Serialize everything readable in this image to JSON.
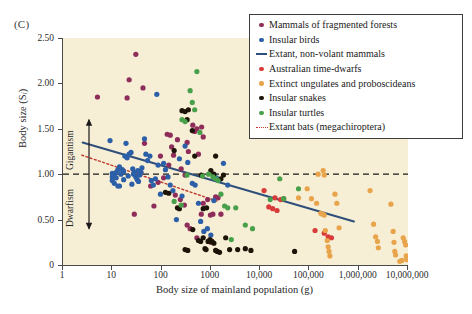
{
  "panel": {
    "label": "(C)"
  },
  "chart_data": {
    "type": "scatter",
    "title": "",
    "xlabel": "Body size of mainland population (g)",
    "ylabel": "Body size (Si)",
    "ylabel_main": "Body size (S",
    "ylabel_sub": "i",
    "ylabel_tail": ")",
    "xscale": "log",
    "xlim": [
      1,
      10000000
    ],
    "ylim": [
      0,
      2.5
    ],
    "grid": false,
    "plot_background": "#f7eed6",
    "xticks": [
      1,
      10,
      100,
      1000,
      10000,
      100000,
      1000000,
      10000000
    ],
    "xticklabels": [
      "1",
      "10",
      "100",
      "1000",
      "10,000",
      "100,000",
      "1,000,000",
      "10,000,000"
    ],
    "yticks": [
      0,
      0.5,
      1.0,
      1.5,
      2.0,
      2.5
    ],
    "yticklabels": [
      "0",
      "0.50",
      "1.00",
      "1.50",
      "2.00",
      "2.50"
    ],
    "reference_line": {
      "y": 1.0,
      "style": "dashed",
      "color": "#1a1a1a",
      "label": ""
    },
    "annotations": [
      {
        "name": "gigantism",
        "text": "Gigantism",
        "y_from": 1.0,
        "y_to": 1.6
      },
      {
        "name": "dwarfism",
        "text": "Dwarfism",
        "y_from": 0.4,
        "y_to": 1.0
      }
    ],
    "legend_position": "upper right",
    "legend": [
      {
        "label": "Mammals of fragmented forests",
        "color": "#8e2d5a",
        "marker": "dot"
      },
      {
        "label": "Insular birds",
        "color": "#2b5fa8",
        "marker": "dot"
      },
      {
        "label": "Extant, non-volant mammals",
        "color": "#2e4f7a",
        "marker": "line"
      },
      {
        "label": "Australian time-dwarfs",
        "color": "#d93a3a",
        "marker": "dot"
      },
      {
        "label": "Extinct ungulates and proboscideans",
        "color": "#e8a44a",
        "marker": "dot"
      },
      {
        "label": "Insular snakes",
        "color": "#1d1408",
        "marker": "dot"
      },
      {
        "label": "Insular turtles",
        "color": "#49a04a",
        "marker": "dot"
      },
      {
        "label": "Extant bats (megachiroptera)",
        "color": "#c0392b",
        "marker": "dotted-line"
      }
    ],
    "trend_lines": [
      {
        "name": "Extant, non-volant mammals",
        "color": "#2e4f7a",
        "style": "solid",
        "width": 2.0,
        "x1": 2.5,
        "y1": 1.35,
        "x2": 800000,
        "y2": 0.48
      },
      {
        "name": "Extant bats (megachiroptera)",
        "color": "#c0392b",
        "style": "dotted",
        "width": 1.4,
        "x1": 2.4,
        "y1": 1.21,
        "x2": 1400,
        "y2": 0.7
      }
    ],
    "series": [
      {
        "name": "Mammals of fragmented forests",
        "color": "#8e2d5a",
        "points": [
          [
            5,
            1.85
          ],
          [
            20,
            1.84
          ],
          [
            22,
            2.04
          ],
          [
            30,
            2.32
          ],
          [
            42,
            1.95
          ],
          [
            28,
            0.56
          ],
          [
            70,
            0.65
          ],
          [
            130,
            1.44
          ],
          [
            150,
            1.43
          ],
          [
            160,
            1.3
          ],
          [
            175,
            1.21
          ],
          [
            210,
            1.38
          ],
          [
            330,
            1.35
          ],
          [
            350,
            1.25
          ],
          [
            430,
            1.54
          ],
          [
            470,
            1.47
          ],
          [
            520,
            1.5
          ],
          [
            560,
            1.22
          ],
          [
            650,
            1.52
          ],
          [
            700,
            1.41
          ],
          [
            95,
            1.2
          ],
          [
            110,
            0.96
          ],
          [
            140,
            1.1
          ],
          [
            240,
            0.72
          ],
          [
            290,
            0.66
          ],
          [
            330,
            0.44
          ],
          [
            380,
            0.4
          ],
          [
            520,
            0.3
          ],
          [
            640,
            0.56
          ],
          [
            700,
            0.68
          ],
          [
            860,
            0.72
          ],
          [
            980,
            0.55
          ],
          [
            1100,
            0.56
          ],
          [
            1250,
            0.75
          ],
          [
            1400,
            0.74
          ],
          [
            1600,
            0.56
          ],
          [
            60,
            0.87
          ],
          [
            85,
            0.91
          ],
          [
            45,
            1.34
          ],
          [
            38,
            1.02
          ],
          [
            250,
            1.06
          ],
          [
            300,
            0.99
          ],
          [
            190,
            0.77
          ],
          [
            900,
            0.26
          ],
          [
            1000,
            0.25
          ]
        ]
      },
      {
        "name": "Insular birds",
        "color": "#2b5fa8",
        "points": [
          [
            9,
            1.37
          ],
          [
            10,
            1.01
          ],
          [
            10,
            0.97
          ],
          [
            10,
            0.93
          ],
          [
            11,
            0.99
          ],
          [
            11,
            0.9
          ],
          [
            12,
            0.96
          ],
          [
            12,
            1.02
          ],
          [
            13,
            1.05
          ],
          [
            13,
            0.87
          ],
          [
            14,
            0.87
          ],
          [
            15,
            1.0
          ],
          [
            16,
            1.05
          ],
          [
            17,
            1.03
          ],
          [
            18,
            1.2
          ],
          [
            19,
            1.34
          ],
          [
            20,
            1.18
          ],
          [
            22,
            1.22
          ],
          [
            24,
            1.24
          ],
          [
            26,
            1.06
          ],
          [
            28,
            1.02
          ],
          [
            30,
            0.97
          ],
          [
            32,
            0.94
          ],
          [
            34,
            0.92
          ],
          [
            36,
            0.99
          ],
          [
            38,
            1.02
          ],
          [
            40,
            1.07
          ],
          [
            45,
            1.39
          ],
          [
            48,
            1.22
          ],
          [
            52,
            1.15
          ],
          [
            58,
            1.2
          ],
          [
            62,
            0.93
          ],
          [
            68,
            0.88
          ],
          [
            75,
            0.95
          ],
          [
            80,
            1.88
          ],
          [
            85,
            1.1
          ],
          [
            95,
            0.78
          ],
          [
            110,
            1.12
          ],
          [
            120,
            1.05
          ],
          [
            135,
            0.97
          ],
          [
            150,
            0.88
          ],
          [
            170,
            0.82
          ],
          [
            200,
            0.5
          ],
          [
            230,
            1.17
          ],
          [
            260,
            0.76
          ],
          [
            300,
            1.31
          ],
          [
            340,
            1.13
          ],
          [
            420,
            0.9
          ],
          [
            480,
            0.88
          ],
          [
            560,
            0.68
          ],
          [
            620,
            0.48
          ],
          [
            720,
            0.37
          ],
          [
            850,
            0.4
          ],
          [
            1000,
            0.33
          ],
          [
            1150,
            0.71
          ],
          [
            1300,
            0.96
          ],
          [
            1500,
            0.94
          ],
          [
            1800,
            1.12
          ],
          [
            2200,
            0.88
          ],
          [
            25,
            0.89
          ],
          [
            27,
            1.0
          ],
          [
            21,
            0.98
          ],
          [
            33,
            1.04
          ],
          [
            17,
            0.94
          ],
          [
            14,
            1.08
          ]
        ]
      },
      {
        "name": "Australian time-dwarfs",
        "color": "#d93a3a",
        "points": [
          [
            12000,
            0.82
          ],
          [
            20000,
            0.74
          ],
          [
            26000,
            0.72
          ],
          [
            30000,
            0.73
          ],
          [
            15000,
            0.64
          ],
          [
            18000,
            0.62
          ],
          [
            22000,
            0.6
          ],
          [
            130000,
            0.38
          ],
          [
            200000,
            0.35
          ],
          [
            240000,
            0.31
          ],
          [
            280000,
            0.3
          ]
        ]
      },
      {
        "name": "Extinct ungulates and proboscideans",
        "color": "#e8a44a",
        "points": [
          [
            150000,
            1.0
          ],
          [
            190000,
            1.04
          ],
          [
            200000,
            0.99
          ],
          [
            110000,
            0.73
          ],
          [
            140000,
            0.68
          ],
          [
            170000,
            0.57
          ],
          [
            185000,
            0.56
          ],
          [
            200000,
            0.55
          ],
          [
            210000,
            0.38
          ],
          [
            230000,
            0.27
          ],
          [
            240000,
            0.2
          ],
          [
            250000,
            0.15
          ],
          [
            260000,
            0.1
          ],
          [
            330000,
            0.78
          ],
          [
            360000,
            0.68
          ],
          [
            400000,
            0.41
          ],
          [
            1700000,
            0.82
          ],
          [
            2000000,
            0.45
          ],
          [
            2200000,
            0.31
          ],
          [
            2400000,
            0.26
          ],
          [
            2500000,
            0.19
          ],
          [
            4500000,
            0.67
          ],
          [
            5000000,
            0.37
          ],
          [
            5200000,
            0.25
          ],
          [
            5400000,
            0.15
          ],
          [
            5600000,
            0.11
          ],
          [
            8000000,
            0.3
          ],
          [
            8500000,
            0.26
          ],
          [
            9000000,
            0.22
          ],
          [
            9200000,
            0.1
          ],
          [
            9400000,
            0.06
          ],
          [
            7500000,
            0.05
          ],
          [
            6800000,
            0.04
          ],
          [
            90000,
            0.84
          ],
          [
            60000,
            0.74
          ]
        ]
      },
      {
        "name": "Insular snakes",
        "color": "#1d1408",
        "points": [
          [
            120,
            0.8
          ],
          [
            140,
            0.79
          ],
          [
            210,
            0.63
          ],
          [
            230,
            0.62
          ],
          [
            260,
            1.7
          ],
          [
            300,
            1.69
          ],
          [
            330,
            1.6
          ],
          [
            350,
            1.71
          ],
          [
            420,
            1.48
          ],
          [
            470,
            1.2
          ],
          [
            300,
            0.17
          ],
          [
            340,
            0.16
          ],
          [
            560,
            0.27
          ],
          [
            620,
            0.26
          ],
          [
            700,
            0.3
          ],
          [
            760,
            0.18
          ],
          [
            800,
            0.17
          ],
          [
            880,
            0.26
          ],
          [
            960,
            0.28
          ],
          [
            1050,
            0.26
          ],
          [
            1150,
            0.24
          ],
          [
            1250,
            0.16
          ],
          [
            1350,
            0.15
          ],
          [
            1500,
            0.14
          ],
          [
            1000,
            1.04
          ],
          [
            1150,
            1.0
          ],
          [
            1250,
            1.2
          ],
          [
            1600,
            0.95
          ],
          [
            1800,
            0.99
          ],
          [
            2000,
            0.3
          ],
          [
            2400,
            0.17
          ],
          [
            3500,
            0.17
          ],
          [
            5000,
            0.18
          ],
          [
            6500,
            0.16
          ],
          [
            50000,
            0.15
          ],
          [
            180,
            1.26
          ],
          [
            700,
            0.62
          ],
          [
            820,
            0.63
          ],
          [
            430,
            0.39
          ],
          [
            640,
            0.99
          ]
        ]
      },
      {
        "name": "Insular turtles",
        "color": "#49a04a",
        "points": [
          [
            260,
            1.6
          ],
          [
            300,
            1.58
          ],
          [
            380,
            1.92
          ],
          [
            420,
            1.79
          ],
          [
            470,
            1.71
          ],
          [
            520,
            2.13
          ],
          [
            600,
            1.46
          ],
          [
            180,
            0.7
          ],
          [
            330,
            0.99
          ],
          [
            900,
            1.0
          ],
          [
            1100,
            0.97
          ],
          [
            1250,
            0.95
          ],
          [
            1400,
            0.93
          ],
          [
            1600,
            0.78
          ],
          [
            1900,
            0.65
          ],
          [
            2200,
            0.63
          ],
          [
            2600,
            0.28
          ],
          [
            3200,
            0.63
          ],
          [
            5000,
            0.44
          ],
          [
            7000,
            0.4
          ],
          [
            25000,
            0.95
          ],
          [
            30000,
            0.73
          ],
          [
            60000,
            0.84
          ],
          [
            16000,
            0.72
          ],
          [
            250,
            0.66
          ],
          [
            680,
            0.98
          ]
        ]
      }
    ]
  }
}
